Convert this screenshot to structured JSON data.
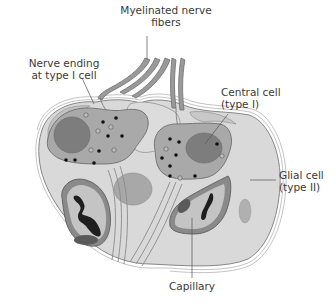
{
  "diagram": {
    "type": "anatomical-illustration",
    "labels": {
      "myelinated_line1": "Myelinated nerve",
      "myelinated_line2": "fibers",
      "nerve_ending_line1": "Nerve ending",
      "nerve_ending_line2": "at type I cell",
      "central_line1": "Central cell",
      "central_line2": "(type I)",
      "glial_line1": "Glial cell",
      "glial_line2": "(type II)",
      "capillary": "Capillary"
    },
    "colors": {
      "background": "#ffffff",
      "glial_fill": "#d9d9d9",
      "cell_fill": "#a9a9a9",
      "nucleus_fill": "#7d7d7d",
      "fiber_fill": "#9a9a9a",
      "capillary_wall": "#8a8a8a",
      "capillary_lumen": "#c4c4c4",
      "rbc_fill": "#1e1e1e",
      "outline": "#6e6e6e",
      "label_text": "#3a3a3a",
      "leader_line": "#555555"
    }
  }
}
